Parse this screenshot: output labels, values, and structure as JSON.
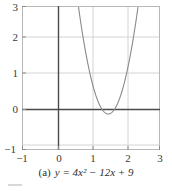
{
  "caption": {
    "tag": "(a)",
    "equation": "y = 4x² − 12x + 9"
  },
  "axes": {
    "x_ticks": [
      "−1",
      "0",
      "1",
      "2",
      "3"
    ],
    "y_ticks": [
      "3",
      "2",
      "1",
      "0",
      "−1"
    ]
  },
  "colors": {
    "curve": "#8a8a8a",
    "axis": "#4a4a4a",
    "grid": "#d0d0d0",
    "frame": "#b8b8b8",
    "text": "#3a3a3a",
    "background": "#ffffff"
  },
  "chart_data": {
    "type": "line",
    "title": "",
    "subtitle": "",
    "xlabel": "",
    "ylabel": "",
    "xlim": [
      -1,
      3
    ],
    "ylim": [
      -1,
      3
    ],
    "xticks": [
      -1,
      0,
      1,
      2,
      3
    ],
    "yticks": [
      -1,
      0,
      1,
      2,
      3
    ],
    "grid": true,
    "legend": null,
    "function": "y = 4x^2 - 12x + 9",
    "vertex": [
      1.5,
      0
    ],
    "roots": [
      1.5
    ],
    "series": [
      {
        "name": "y = 4x² − 12x + 9",
        "color": "#8a8a8a",
        "x": [
          0.63,
          0.7,
          0.8,
          0.9,
          1.0,
          1.1,
          1.2,
          1.3,
          1.4,
          1.5,
          1.6,
          1.7,
          1.8,
          1.9,
          2.0,
          2.1,
          2.2,
          2.3,
          2.37
        ],
        "y": [
          3.0,
          2.56,
          1.96,
          1.44,
          1.0,
          0.64,
          0.36,
          0.16,
          0.04,
          0.0,
          0.04,
          0.16,
          0.36,
          0.64,
          1.0,
          1.44,
          1.96,
          2.56,
          3.0
        ]
      }
    ]
  }
}
